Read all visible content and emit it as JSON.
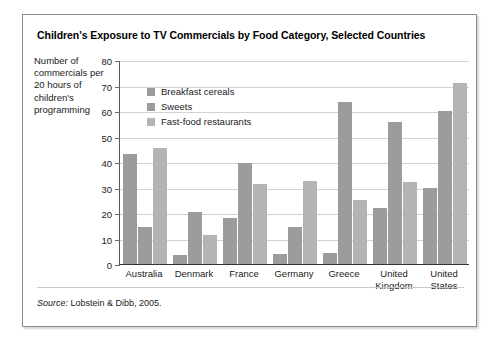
{
  "figure": {
    "title": "Children's Exposure to TV Commercials by Food Category, Selected Countries",
    "source_label": "Source:",
    "source_text": " Lobstein & Dibb, 2005."
  },
  "chart_data": {
    "type": "bar",
    "title": "Children's Exposure to TV Commercials by Food Category, Selected Countries",
    "xlabel": "",
    "ylabel": "Number of commercials per 20 hours of children's programming",
    "ylim": [
      0,
      80
    ],
    "yticks": [
      0,
      10,
      20,
      30,
      40,
      50,
      60,
      70,
      80
    ],
    "ytick_labels": [
      "0",
      "10",
      "20",
      "30",
      "40",
      "50",
      "60",
      "70",
      "80"
    ],
    "grid": true,
    "legend_position": "upper-left-inside",
    "categories": [
      "Australia",
      "Denmark",
      "France",
      "Germany",
      "Greece",
      "United Kingdom",
      "United States"
    ],
    "category_label_lines": [
      [
        "Australia"
      ],
      [
        "Denmark"
      ],
      [
        "France"
      ],
      [
        "Germany"
      ],
      [
        "Greece"
      ],
      [
        "United",
        "Kingdom"
      ],
      [
        "United",
        "States"
      ]
    ],
    "series": [
      {
        "name": "Breakfast cereals",
        "color": "#9c9c9c",
        "values": [
          43,
          3.5,
          18,
          4,
          4.5,
          22,
          30
        ]
      },
      {
        "name": "Sweets",
        "color": "#9c9c9c",
        "values": [
          14.5,
          20.5,
          39.5,
          14.5,
          63.5,
          55.5,
          60
        ]
      },
      {
        "name": "Fast-food restaurants",
        "color": "#b4b4b4",
        "values": [
          45.5,
          11.5,
          31.5,
          32.5,
          25,
          32,
          71
        ]
      }
    ]
  }
}
